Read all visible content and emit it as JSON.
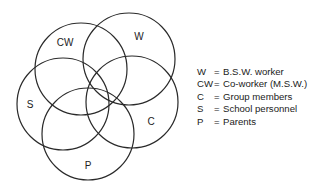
{
  "diagram": {
    "type": "venn",
    "circles": [
      {
        "id": "CW",
        "cx": 81,
        "cy": 69,
        "r": 46,
        "label": "CW",
        "lx": 65,
        "ly": 43
      },
      {
        "id": "W",
        "cx": 129,
        "cy": 59,
        "r": 46,
        "label": "W",
        "lx": 139,
        "ly": 37
      },
      {
        "id": "S",
        "cx": 63,
        "cy": 104,
        "r": 46,
        "label": "S",
        "lx": 30,
        "ly": 105
      },
      {
        "id": "C",
        "cx": 132,
        "cy": 102,
        "r": 46,
        "label": "C",
        "lx": 151,
        "ly": 122
      },
      {
        "id": "P",
        "cx": 88,
        "cy": 134,
        "r": 46,
        "label": "P",
        "lx": 88,
        "ly": 166
      }
    ],
    "stroke_color": "#2a2a2a"
  },
  "legend": {
    "items": [
      {
        "key": "W",
        "eq": "=",
        "text": "B.S.W. worker"
      },
      {
        "key": "CW",
        "eq": "=",
        "text": "Co-worker (M.S.W.)"
      },
      {
        "key": "C",
        "eq": "=",
        "text": "Group members"
      },
      {
        "key": "S",
        "eq": "=",
        "text": "School personnel"
      },
      {
        "key": "P",
        "eq": "=",
        "text": "Parents"
      }
    ]
  }
}
